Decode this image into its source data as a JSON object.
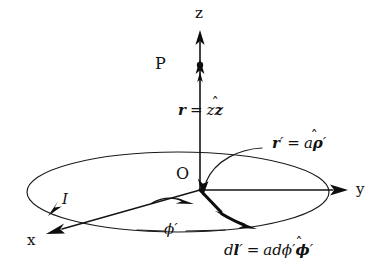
{
  "figure": {
    "background_color": "#ffffff",
    "ink_color": "#111111",
    "width": 380,
    "height": 275
  },
  "axes": {
    "z": {
      "label": "z",
      "direction": "up"
    },
    "y": {
      "label": "y",
      "direction": "right"
    },
    "x": {
      "label": "x",
      "direction": "lower-left"
    },
    "origin_label": "O"
  },
  "points": {
    "field_point_label": "P"
  },
  "current": {
    "label": "I",
    "sense": "clockwise-as-drawn"
  },
  "angle": {
    "label_phi": "ϕ",
    "label_prime": "′"
  },
  "vectors": {
    "r": {
      "name": "r",
      "equals": "=",
      "magnitude": "z",
      "unit_hat": "ẑ",
      "unit_base": "z",
      "full_text": "r = zẑ"
    },
    "r_prime": {
      "name": "r",
      "prime": "′",
      "equals": "=",
      "magnitude": "a",
      "unit_base": "ρ",
      "unit_prime": "′",
      "full_text": "r′ = aρ̂′"
    },
    "dl_prime": {
      "differential": "d",
      "name": "l",
      "prime": "′",
      "equals": "=",
      "magnitude_a": "a",
      "magnitude_d": "d",
      "magnitude_phi": "ϕ",
      "magnitude_prime": "′",
      "unit_base": "ϕ",
      "unit_prime": "′",
      "full_text": "dl′ = adϕ′ϕ̂′"
    }
  },
  "shapes": {
    "loop": {
      "type": "ellipse",
      "cx": 178,
      "cy": 192,
      "rx": 151,
      "ry": 40
    },
    "radius_vector_tip": {
      "x": 222,
      "y": 214
    }
  }
}
